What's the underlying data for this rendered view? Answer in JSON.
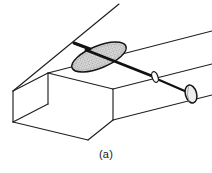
{
  "figure": {
    "caption": "(a)",
    "title": "",
    "colors": {
      "line": "#1c1c1c",
      "thin_line": "#3a3a3a",
      "background": "#ffffff",
      "damper_fill": "#d9d9d9",
      "damper_stipple": "#8a8a8a",
      "shaft": "#111111",
      "handle_fill": "#e8e8e8"
    },
    "parts": [
      {
        "id": "duct",
        "label": "rectangular duct"
      },
      {
        "id": "damper-plate",
        "label": "butterfly damper plate"
      },
      {
        "id": "shaft",
        "label": "damper operating shaft"
      },
      {
        "id": "bushing",
        "label": "shaft bushing"
      },
      {
        "id": "handle",
        "label": "operating handle knob"
      },
      {
        "id": "pin",
        "label": "damper pivot pin"
      }
    ],
    "geometry": {
      "duct": {
        "top_face": "M 12,90 L 78,28 L 212,3 L 212,3",
        "front_face_top_left": "12,90",
        "front_face_bottom_left": "12,121",
        "open_end_top_back": "47,72",
        "open_end_bottom_back": "47,103"
      },
      "damper_ellipse": {
        "cx": 99,
        "cy": 57,
        "rx": 29,
        "ry": 11,
        "rotation_deg": -22
      },
      "shaft": {
        "x1": 85,
        "y1": 49,
        "x2": 188,
        "y2": 92
      },
      "handle": {
        "cx": 190,
        "cy": 93,
        "rx": 5.5,
        "ry": 9,
        "rotation_deg": -18
      },
      "bushing": {
        "cx": 155,
        "cy": 77,
        "rx": 3,
        "ry": 5.5,
        "rotation_deg": -20
      }
    }
  }
}
